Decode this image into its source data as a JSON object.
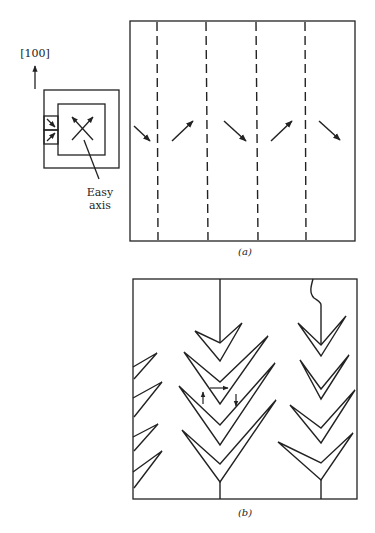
{
  "figure": {
    "direction_label": "[100]",
    "easy_axis_label_line1": "Easy",
    "easy_axis_label_line2": "axis",
    "caption_a": "(a)",
    "caption_b": "(b)",
    "panel_a": {
      "description": "Stripe domains separated by dashed domain walls with alternating magnetization arrows",
      "domain_walls": 4,
      "arrows": [
        "down-right",
        "up-right",
        "down-right",
        "up-right",
        "down-right"
      ]
    },
    "panel_b": {
      "description": "Fir-tree (herringbone) closure domain patterns",
      "trees": 3
    },
    "colors": {
      "ink": "#222222",
      "background": "#ffffff"
    }
  }
}
